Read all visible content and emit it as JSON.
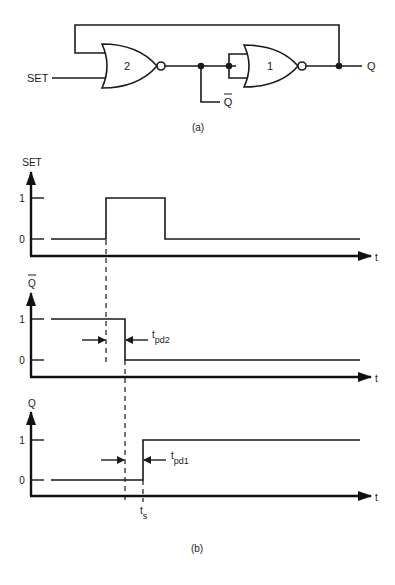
{
  "circuit": {
    "caption": "(a)",
    "input_label": "SET",
    "output_label": "Q",
    "complement_label": "Q",
    "gates": [
      {
        "id": "2",
        "label": "2",
        "type": "NOR"
      },
      {
        "id": "1",
        "label": "1",
        "type": "NOR"
      }
    ]
  },
  "timing": {
    "caption": "(b)",
    "time_axis_label": "t",
    "level_high": "1",
    "level_low": "0",
    "traces": [
      {
        "name": "SET",
        "label": "SET",
        "overbar": false
      },
      {
        "name": "Qbar",
        "label": "Q",
        "overbar": true
      },
      {
        "name": "Q",
        "label": "Q",
        "overbar": false
      }
    ],
    "annotations": {
      "tpd2": {
        "main": "t",
        "sub": "pd2"
      },
      "tpd1": {
        "main": "t",
        "sub": "pd1"
      },
      "ts": {
        "main": "t",
        "sub": "s"
      }
    }
  },
  "colors": {
    "ink": "#1a1a1a",
    "background": "#ffffff"
  }
}
